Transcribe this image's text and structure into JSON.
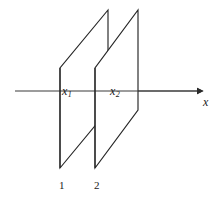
{
  "figure": {
    "type": "technical-line-diagram",
    "background_color": "#ffffff",
    "line_color": "#262626",
    "label_color": "#1a1a1a",
    "axis": {
      "name": "x-axis",
      "label": "x",
      "arrow": "right",
      "start_x": 15,
      "end_x": 200,
      "y": 91
    },
    "planes": [
      {
        "id": "plane-1",
        "number_label": "1",
        "position_label": "x",
        "position_subscript": "1",
        "bottom_left": [
          60,
          168
        ],
        "top_left": [
          60,
          68
        ],
        "top_right": [
          108,
          10
        ],
        "bottom_right": [
          108,
          110
        ]
      },
      {
        "id": "plane-2",
        "number_label": "2",
        "position_label": "x",
        "position_subscript": "2",
        "bottom_left": [
          95,
          168
        ],
        "top_left": [
          95,
          68
        ],
        "top_right": [
          138,
          10
        ],
        "bottom_right": [
          138,
          110
        ]
      }
    ]
  }
}
